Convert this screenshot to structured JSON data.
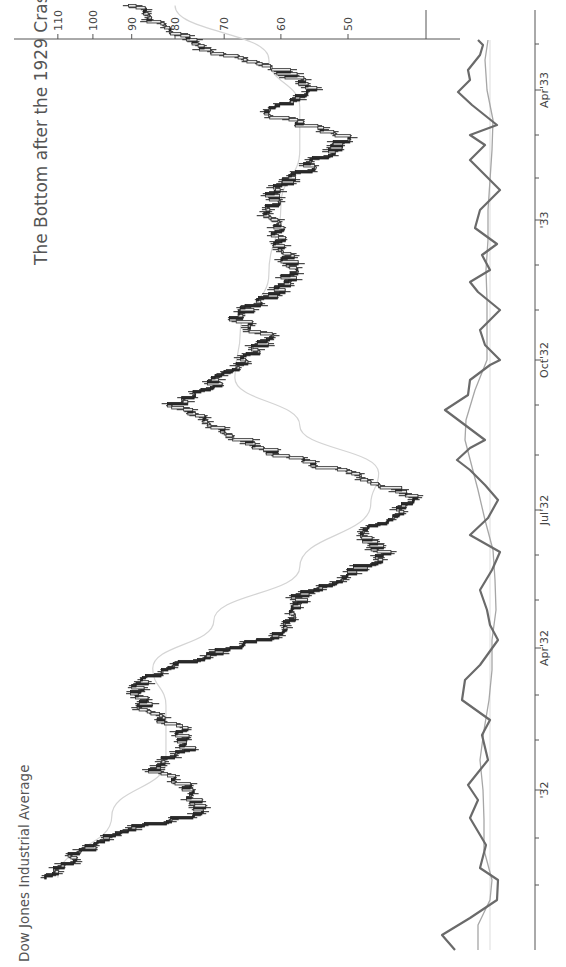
{
  "title": "The Bottom after the 1929 Crash",
  "subtitle": "Dow Jones Industrial Average",
  "orientation": "rotated-90-clockwise",
  "colors": {
    "up_candle_fill": "#e8e8e8",
    "down_candle_fill": "#2a2a2a",
    "moving_average": "#d4d4d4",
    "oscillator_main": "#6a6a6a",
    "oscillator_signal": "#a6a6a6",
    "axis": "#555555"
  },
  "price_axis": {
    "ticks": [
      {
        "label": "110",
        "value": 110
      },
      {
        "label": "100",
        "value": 100
      },
      {
        "label": "90",
        "value": 90
      },
      {
        "label": "80",
        "value": 80
      },
      {
        "label": "70",
        "value": 70
      },
      {
        "label": "60",
        "value": 60
      },
      {
        "label": "50",
        "value": 50
      }
    ],
    "scale": "log"
  },
  "time_axis": {
    "ticks": [
      {
        "label": "Apr'33",
        "pos": 90
      },
      {
        "label": "'33",
        "pos": 220
      },
      {
        "label": "Oct'32",
        "pos": 360
      },
      {
        "label": "Jul'32",
        "pos": 510
      },
      {
        "label": "Apr'32",
        "pos": 648
      },
      {
        "label": "'32",
        "pos": 790
      }
    ],
    "minor_ticks": [
      44,
      135,
      178,
      265,
      310,
      405,
      455,
      555,
      600,
      695,
      740,
      838,
      885
    ]
  },
  "chart_data": {
    "type": "candlestick",
    "title": "The Bottom after the 1929 Crash",
    "subtitle": "Dow Jones Industrial Average",
    "xlabel": "",
    "ylabel": "",
    "scale": "log",
    "ylim": [
      40,
      115
    ],
    "x_tick_labels": [
      "'32",
      "Apr'32",
      "Jul'32",
      "Oct'32",
      "'33",
      "Apr'33"
    ],
    "y_tick_labels": [
      "50",
      "60",
      "70",
      "80",
      "90",
      "100",
      "110"
    ],
    "price_path": [
      {
        "date": "1931-11-05",
        "close": 114
      },
      {
        "date": "1931-11-20",
        "close": 104
      },
      {
        "date": "1931-12-05",
        "close": 92
      },
      {
        "date": "1931-12-17",
        "close": 74
      },
      {
        "date": "1932-01-05",
        "close": 79
      },
      {
        "date": "1932-01-14",
        "close": 85
      },
      {
        "date": "1932-01-28",
        "close": 77
      },
      {
        "date": "1932-02-10",
        "close": 79
      },
      {
        "date": "1932-02-19",
        "close": 86
      },
      {
        "date": "1932-03-08",
        "close": 89
      },
      {
        "date": "1932-03-22",
        "close": 80
      },
      {
        "date": "1932-04-08",
        "close": 62
      },
      {
        "date": "1932-04-22",
        "close": 58
      },
      {
        "date": "1932-05-05",
        "close": 57
      },
      {
        "date": "1932-05-20",
        "close": 50
      },
      {
        "date": "1932-06-01",
        "close": 45
      },
      {
        "date": "1932-06-15",
        "close": 48
      },
      {
        "date": "1932-07-08",
        "close": 41.2
      },
      {
        "date": "1932-07-20",
        "close": 47
      },
      {
        "date": "1932-08-05",
        "close": 60
      },
      {
        "date": "1932-08-20",
        "close": 70
      },
      {
        "date": "1932-09-07",
        "close": 79.9
      },
      {
        "date": "1932-09-20",
        "close": 72
      },
      {
        "date": "1932-10-05",
        "close": 67
      },
      {
        "date": "1932-10-20",
        "close": 62
      },
      {
        "date": "1932-11-03",
        "close": 68
      },
      {
        "date": "1932-11-20",
        "close": 60
      },
      {
        "date": "1932-12-05",
        "close": 58
      },
      {
        "date": "1932-12-20",
        "close": 60
      },
      {
        "date": "1933-01-10",
        "close": 62
      },
      {
        "date": "1933-01-25",
        "close": 61
      },
      {
        "date": "1933-02-10",
        "close": 55
      },
      {
        "date": "1933-02-27",
        "close": 50.2
      },
      {
        "date": "1933-03-15",
        "close": 62
      },
      {
        "date": "1933-03-31",
        "close": 55
      },
      {
        "date": "1933-04-12",
        "close": 60
      },
      {
        "date": "1933-04-25",
        "close": 73
      },
      {
        "date": "1933-05-10",
        "close": 82
      },
      {
        "date": "1933-05-25",
        "close": 90
      }
    ],
    "moving_average_path": [
      {
        "date": "1931-11-05",
        "value": 110
      },
      {
        "date": "1931-12-15",
        "value": 95
      },
      {
        "date": "1932-01-20",
        "value": 82
      },
      {
        "date": "1932-02-25",
        "value": 82
      },
      {
        "date": "1932-03-20",
        "value": 85
      },
      {
        "date": "1932-04-20",
        "value": 72
      },
      {
        "date": "1932-05-25",
        "value": 57
      },
      {
        "date": "1932-07-05",
        "value": 47
      },
      {
        "date": "1932-07-25",
        "value": 46
      },
      {
        "date": "1932-08-25",
        "value": 57
      },
      {
        "date": "1932-09-25",
        "value": 68
      },
      {
        "date": "1932-10-25",
        "value": 67
      },
      {
        "date": "1932-12-01",
        "value": 62
      },
      {
        "date": "1933-01-15",
        "value": 60
      },
      {
        "date": "1933-02-20",
        "value": 57
      },
      {
        "date": "1933-03-20",
        "value": 57
      },
      {
        "date": "1933-04-20",
        "value": 62
      },
      {
        "date": "1933-05-25",
        "value": 80
      }
    ],
    "oscillator": {
      "zero_level_pos": 490,
      "main_points": [
        [
          455,
          950
        ],
        [
          442,
          935
        ],
        [
          470,
          918
        ],
        [
          497,
          900
        ],
        [
          498,
          880
        ],
        [
          480,
          868
        ],
        [
          486,
          845
        ],
        [
          470,
          818
        ],
        [
          478,
          800
        ],
        [
          468,
          785
        ],
        [
          488,
          760
        ],
        [
          482,
          735
        ],
        [
          490,
          720
        ],
        [
          462,
          700
        ],
        [
          465,
          680
        ],
        [
          480,
          665
        ],
        [
          498,
          640
        ],
        [
          490,
          625
        ],
        [
          487,
          610
        ],
        [
          480,
          590
        ],
        [
          492,
          570
        ],
        [
          500,
          552
        ],
        [
          470,
          535
        ],
        [
          488,
          518
        ],
        [
          498,
          500
        ],
        [
          485,
          485
        ],
        [
          470,
          470
        ],
        [
          457,
          460
        ],
        [
          470,
          448
        ],
        [
          485,
          440
        ],
        [
          445,
          410
        ],
        [
          468,
          395
        ],
        [
          470,
          380
        ],
        [
          490,
          365
        ],
        [
          500,
          360
        ],
        [
          485,
          345
        ],
        [
          480,
          330
        ],
        [
          500,
          310
        ],
        [
          478,
          292
        ],
        [
          470,
          282
        ],
        [
          490,
          270
        ],
        [
          482,
          255
        ],
        [
          497,
          244
        ],
        [
          475,
          228
        ],
        [
          480,
          210
        ],
        [
          500,
          190
        ],
        [
          470,
          160
        ],
        [
          485,
          145
        ],
        [
          470,
          135
        ],
        [
          497,
          125
        ],
        [
          472,
          105
        ],
        [
          458,
          92
        ],
        [
          470,
          80
        ],
        [
          468,
          70
        ],
        [
          480,
          55
        ],
        [
          483,
          45
        ],
        [
          478,
          40
        ]
      ],
      "signal_points": [
        [
          478,
          950
        ],
        [
          478,
          925
        ],
        [
          490,
          900
        ],
        [
          492,
          880
        ],
        [
          484,
          850
        ],
        [
          484,
          820
        ],
        [
          483,
          790
        ],
        [
          480,
          760
        ],
        [
          484,
          730
        ],
        [
          489,
          700
        ],
        [
          492,
          670
        ],
        [
          492,
          640
        ],
        [
          496,
          610
        ],
        [
          495,
          580
        ],
        [
          493,
          550
        ],
        [
          485,
          520
        ],
        [
          478,
          490
        ],
        [
          465,
          440
        ],
        [
          466,
          420
        ],
        [
          475,
          390
        ],
        [
          487,
          360
        ],
        [
          487,
          330
        ],
        [
          487,
          300
        ],
        [
          486,
          270
        ],
        [
          488,
          240
        ],
        [
          488,
          210
        ],
        [
          490,
          180
        ],
        [
          492,
          150
        ],
        [
          493,
          120
        ],
        [
          487,
          90
        ],
        [
          485,
          60
        ],
        [
          488,
          40
        ]
      ]
    }
  }
}
